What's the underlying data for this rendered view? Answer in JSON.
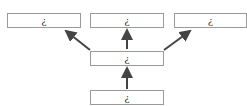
{
  "diagram": {
    "top_row": [
      {
        "label": "¿"
      },
      {
        "label": "¿"
      },
      {
        "label": "¿"
      }
    ],
    "middle": {
      "label": "¿"
    },
    "bottom": {
      "label": "¿"
    },
    "edges": [
      {
        "from": "bottom",
        "to": "middle"
      },
      {
        "from": "middle",
        "to": "top_left"
      },
      {
        "from": "middle",
        "to": "top_center"
      },
      {
        "from": "middle",
        "to": "top_right"
      }
    ],
    "colors": {
      "border": "#9a9a9a",
      "arrow": "#444444"
    }
  }
}
